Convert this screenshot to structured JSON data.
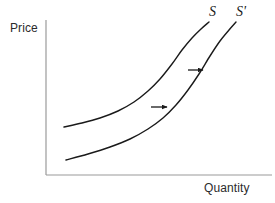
{
  "figure": {
    "type": "economics-supply-shift-diagram",
    "background_color": "#ffffff",
    "width": 275,
    "height": 203
  },
  "axes": {
    "y_label": "Price",
    "x_label": "Quantity",
    "axis_color": "#9a9a9a",
    "origin": {
      "x": 46,
      "y": 175
    },
    "y_axis_top": {
      "x": 46,
      "y": 20
    },
    "x_axis_right": {
      "x": 272,
      "y": 175
    },
    "ticks": [],
    "grid": false
  },
  "curves": [
    {
      "name": "S",
      "label": "S",
      "label_position": {
        "x": 209,
        "y": 4
      },
      "color": "#1a1a1a",
      "stroke_width": 1.4,
      "description": "original upward-sloping supply curve, convex, flattening at low quantity",
      "points": [
        [
          64,
          127
        ],
        [
          82,
          123
        ],
        [
          100,
          118
        ],
        [
          118,
          111
        ],
        [
          134,
          102
        ],
        [
          148,
          91
        ],
        [
          160,
          79
        ],
        [
          172,
          64
        ],
        [
          182,
          50
        ],
        [
          192,
          38
        ],
        [
          201,
          29
        ],
        [
          209,
          22
        ]
      ]
    },
    {
      "name": "S'",
      "label": "S'",
      "label_position": {
        "x": 236,
        "y": 4
      },
      "color": "#1a1a1a",
      "stroke_width": 1.4,
      "description": "shifted supply curve, moved rightward and downward from S",
      "points": [
        [
          66,
          160
        ],
        [
          88,
          154
        ],
        [
          110,
          147
        ],
        [
          130,
          139
        ],
        [
          148,
          129
        ],
        [
          163,
          118
        ],
        [
          176,
          105
        ],
        [
          188,
          90
        ],
        [
          199,
          74
        ],
        [
          210,
          56
        ],
        [
          220,
          41
        ],
        [
          229,
          30
        ],
        [
          236,
          22
        ]
      ]
    }
  ],
  "arrows": [
    {
      "name": "shift-arrow-upper",
      "from": {
        "x": 188,
        "y": 70
      },
      "to": {
        "x": 204,
        "y": 70
      },
      "color": "#1a1a1a",
      "direction": "right"
    },
    {
      "name": "shift-arrow-lower",
      "from": {
        "x": 151,
        "y": 107
      },
      "to": {
        "x": 168,
        "y": 107
      },
      "color": "#1a1a1a",
      "direction": "right"
    }
  ],
  "chart_data": {
    "type": "line",
    "title": "",
    "subtitle": "",
    "xlabel": "Quantity",
    "ylabel": "Price",
    "xlim": [
      0,
      100
    ],
    "ylim": [
      0,
      100
    ],
    "grid": false,
    "legend": "inline-curve-labels",
    "annotations": [
      "S",
      "S'",
      "rightward shift arrow (upper)",
      "rightward shift arrow (lower)"
    ],
    "series": [
      {
        "name": "S",
        "label": "S",
        "x": [
          8,
          16,
          24,
          32,
          39,
          45,
          50,
          56,
          60,
          65,
          69,
          72
        ],
        "y": [
          31,
          34,
          37,
          41,
          47,
          54,
          62,
          72,
          81,
          88,
          94,
          99
        ]
      },
      {
        "name": "S'",
        "label": "S'",
        "x": [
          9,
          19,
          28,
          37,
          45,
          52,
          58,
          63,
          68,
          73,
          77,
          81,
          84
        ],
        "y": [
          10,
          14,
          18,
          23,
          30,
          37,
          45,
          55,
          65,
          76,
          85,
          92,
          99
        ]
      }
    ]
  }
}
